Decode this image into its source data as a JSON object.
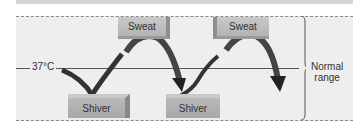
{
  "diagram": {
    "setpoint": {
      "label": "37°C"
    },
    "range": {
      "label_line1": "Normal",
      "label_line2": "range"
    },
    "responses": {
      "sweat": [
        {
          "label": "Sweat"
        },
        {
          "label": "Sweat"
        }
      ],
      "shiver": [
        {
          "label": "Shiver"
        },
        {
          "label": "Shiver"
        }
      ]
    },
    "colors": {
      "panel": "#eeeeee",
      "box": "#bdbdbd",
      "arrow": "#3a3a3a",
      "dash": "#8a8a8a"
    }
  }
}
